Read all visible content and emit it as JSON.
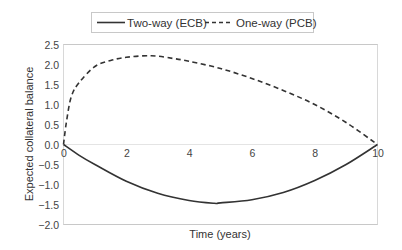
{
  "chart_data": {
    "type": "line",
    "title": "",
    "xlabel": "Time (years)",
    "ylabel": "Expected collateral balance",
    "xlim": [
      0,
      10
    ],
    "ylim": [
      -2.0,
      2.5
    ],
    "xticks": [
      "0",
      "2",
      "4",
      "6",
      "8",
      "10"
    ],
    "yticks": [
      "2.5",
      "2.0",
      "1.5",
      "1.0",
      "0.5",
      "0.0",
      "−0.5",
      "−1.0",
      "−1.5",
      "−2.0"
    ],
    "grid": false,
    "legend_position": "top",
    "series": [
      {
        "name": "Two-way (ECB)",
        "style": "solid",
        "color": "#333333",
        "x": [
          0,
          0.5,
          1,
          2,
          3,
          4,
          4.8,
          5,
          6,
          7,
          8,
          9,
          10
        ],
        "values": [
          0,
          -0.27,
          -0.5,
          -0.92,
          -1.22,
          -1.4,
          -1.47,
          -1.46,
          -1.38,
          -1.2,
          -0.9,
          -0.5,
          0
        ]
      },
      {
        "name": "One-way (PCB)",
        "style": "dashed",
        "color": "#333333",
        "x": [
          0,
          0.1,
          0.25,
          0.5,
          1,
          1.5,
          2,
          2.8,
          3.5,
          4,
          5,
          6,
          7,
          8,
          9,
          10
        ],
        "values": [
          0,
          0.6,
          1.2,
          1.55,
          1.95,
          2.1,
          2.18,
          2.22,
          2.15,
          2.08,
          1.9,
          1.65,
          1.35,
          1.0,
          0.55,
          0
        ]
      }
    ]
  },
  "legend": {
    "items": [
      {
        "label": "Two-way (ECB)",
        "style": "solid"
      },
      {
        "label": "One-way (PCB)",
        "style": "dashed"
      }
    ]
  },
  "colors": {
    "line": "#333333",
    "frame": "#c8c8c8",
    "text": "#444444"
  }
}
